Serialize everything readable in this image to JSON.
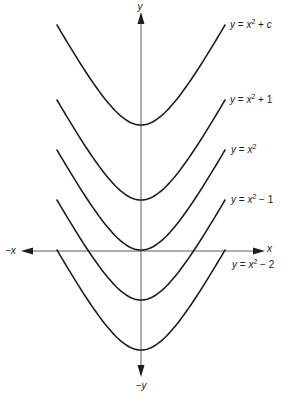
{
  "figure": {
    "axes": {
      "y_pos_label": "y",
      "y_neg_label": "−y",
      "x_pos_label": "x",
      "x_neg_label": "−x"
    },
    "curves": [
      {
        "y": "y",
        "eq": " = ",
        "x": "x",
        "exp": "2",
        "op": " + ",
        "const": "c"
      },
      {
        "y": "y",
        "eq": " = ",
        "x": "x",
        "exp": "2",
        "op": " + ",
        "const": "1"
      },
      {
        "y": "y",
        "eq": " = ",
        "x": "x",
        "exp": "2",
        "op": "",
        "const": ""
      },
      {
        "y": "y",
        "eq": " = ",
        "x": "x",
        "exp": "2",
        "op": " − ",
        "const": "1"
      },
      {
        "y": "y",
        "eq": " = ",
        "x": "x",
        "exp": "2",
        "op": " − ",
        "const": "2"
      }
    ]
  },
  "chart_data": {
    "type": "line",
    "title": "",
    "xlabel": "x",
    "ylabel": "y",
    "axis_labels": {
      "positive_x": "x",
      "negative_x": "−x",
      "positive_y": "y",
      "negative_y": "−y"
    },
    "grid": false,
    "ticks": false,
    "legend": "labels at right end of each curve",
    "series": [
      {
        "name": "y = x² + c",
        "expression": "x^2 + c",
        "vertical_shift": "c"
      },
      {
        "name": "y = x² + 1",
        "expression": "x^2 + 1",
        "vertical_shift": 1
      },
      {
        "name": "y = x²",
        "expression": "x^2",
        "vertical_shift": 0
      },
      {
        "name": "y = x² − 1",
        "expression": "x^2 - 1",
        "vertical_shift": -1
      },
      {
        "name": "y = x² − 2",
        "expression": "x^2 - 2",
        "vertical_shift": -2
      }
    ],
    "render": {
      "axis_x_px": 141,
      "axis_y_px": 251,
      "vertex_y_px": [
        125,
        200,
        250,
        300,
        350
      ],
      "half_width_px": 84,
      "depth_px": 100,
      "curvature_px": 40,
      "colors": {
        "curve": "#1e1e1e",
        "axis": "#5a5a5a"
      }
    }
  }
}
